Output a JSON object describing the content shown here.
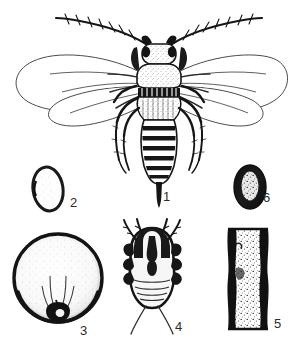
{
  "plate": {
    "title": "",
    "background_color": "#ffffff",
    "ink_color": "#1a1a1a",
    "medium": "line engraving / stipple scientific illustration",
    "width": 297,
    "height": 345
  },
  "figures": [
    {
      "number": "1",
      "label_x": 163,
      "label_y": 190,
      "subject": "adult winged insect, dorsal view",
      "details": "two long segmented antennae with bristles, banded thorax, four elongate oval veined wings, six legs, segmented abdomen with dark transverse bands, pointed terminal ovipositor"
    },
    {
      "number": "2",
      "label_x": 70,
      "label_y": 196,
      "subject": "egg, outline oval",
      "details": "pale ovoid with thick dark rim"
    },
    {
      "number": "3",
      "label_x": 80,
      "label_y": 324,
      "subject": "gall / puparium, round",
      "details": "near-circular body with heavy dark rim, stippled interior and a dark notched opening at the base"
    },
    {
      "number": "4",
      "label_x": 175,
      "label_y": 320,
      "subject": "nymph, dorsal view",
      "details": "broad dark nymph with paired leg and antennal projections, segmented abdomen and two long caudal filaments"
    },
    {
      "number": "5",
      "label_x": 274,
      "label_y": 317,
      "subject": "infested twig segment",
      "details": "vertical stem section with heavy black margins and stippled pale core"
    },
    {
      "number": "6",
      "label_x": 263,
      "label_y": 191,
      "subject": "egg, solid dark oval",
      "details": "filled black ovoid with pale stippled centre"
    }
  ]
}
